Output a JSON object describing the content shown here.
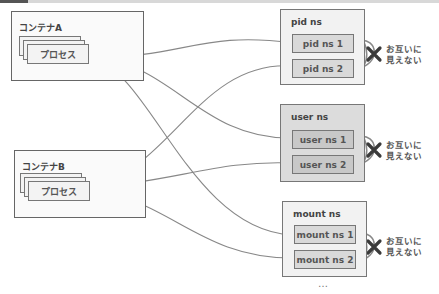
{
  "containers": [
    {
      "title": "コンテナA",
      "process_label": "プロセス"
    },
    {
      "title": "コンテナB",
      "process_label": "プロセス"
    }
  ],
  "namespaces": [
    {
      "title": "pid ns",
      "items": [
        "pid ns 1",
        "pid ns 2"
      ],
      "note_line1": "お互いに",
      "note_line2": "見えない"
    },
    {
      "title": "user ns",
      "items": [
        "user ns 1",
        "user ns 2"
      ],
      "note_line1": "お互いに",
      "note_line2": "見えない"
    },
    {
      "title": "mount ns",
      "items": [
        "mount ns 1",
        "mount ns 2"
      ],
      "note_line1": "お互いに",
      "note_line2": "見えない"
    }
  ],
  "ellipsis": "…",
  "colors": {
    "line": "#777777",
    "cross": "#333333",
    "highlight_ns": "#dcdcdc"
  }
}
